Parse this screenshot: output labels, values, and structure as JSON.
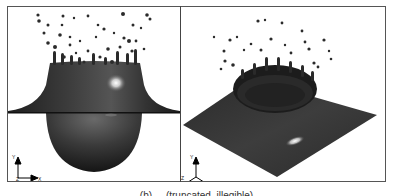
{
  "figure": {
    "panels": [
      {
        "id": "side-view",
        "description": "Side view of droplet impact crown splash on liquid film with cavity below",
        "axes": {
          "up": "Y",
          "right": "X",
          "origin": "Z"
        }
      },
      {
        "id": "isometric-view",
        "description": "Isometric view of crown splash on square liquid film",
        "axes": {
          "up": "Y",
          "left": "Z",
          "right": "X"
        }
      }
    ],
    "caption": "(b)  ...  (truncated, illegible)"
  }
}
